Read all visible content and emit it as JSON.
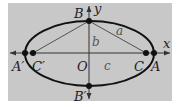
{
  "diagram": {
    "type": "ellipse-geometry",
    "background_color": "#c8c8c8",
    "page_color": "#ffffff",
    "stroke_color": "#111111",
    "axis_color": "#333333",
    "segment_color": "#444444",
    "label_color": "#222222",
    "axes": {
      "x_label": "x",
      "y_label": "y"
    },
    "points": {
      "A": "A",
      "A_prime": "A′",
      "B": "B",
      "B_prime": "B′",
      "C": "C",
      "C_prime": "C′",
      "O": "O"
    },
    "segments": {
      "a": "a",
      "b": "b",
      "c": "c"
    }
  }
}
